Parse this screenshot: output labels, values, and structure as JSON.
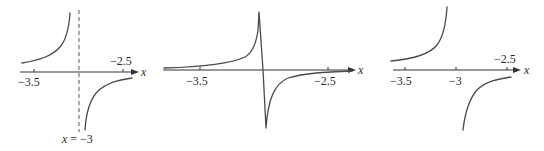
{
  "figure": {
    "panels": [
      {
        "id": "panel-1",
        "axis_label": "x",
        "ticks": [
          {
            "value": -3.5,
            "label": "−3.5",
            "position": "below"
          },
          {
            "value": -2.5,
            "label": "−2.5",
            "position": "above"
          }
        ],
        "asymptote": {
          "value": -3,
          "style": "dashed",
          "label": "x = −3"
        },
        "description": "Two branches of a vertical-asymptote graph: left branch rises to +infinity approaching x=-3 from the left, right branch rises from -infinity toward 0 for x>-3"
      },
      {
        "id": "panel-2",
        "axis_label": "x",
        "ticks": [
          {
            "value": -3.5,
            "label": "−3.5",
            "position": "below"
          },
          {
            "value": -2.5,
            "label": "−2.5",
            "position": "below"
          }
        ],
        "description": "Continuous-looking plot: curve spikes up sharply then plunges down near x=-3 and recovers toward the axis"
      },
      {
        "id": "panel-3",
        "axis_label": "x",
        "ticks": [
          {
            "value": -3.5,
            "label": "−3.5",
            "position": "below"
          },
          {
            "value": -3,
            "label": "−3",
            "position": "below"
          },
          {
            "value": -2.5,
            "label": "−2.5",
            "position": "above"
          }
        ],
        "description": "Two separate branches without a drawn asymptote: left branch increases toward +infinity before x=-3, right branch increases from -infinity after x=-3"
      }
    ],
    "colors": {
      "curve": "#4a4a4a",
      "axis": "#333333",
      "background": "#ffffff"
    }
  }
}
